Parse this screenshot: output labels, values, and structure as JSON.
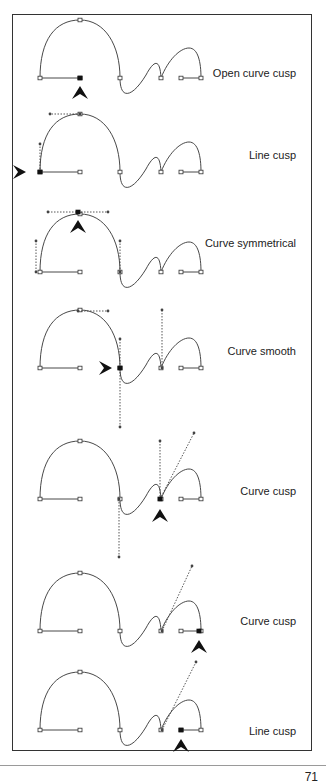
{
  "colors": {
    "stroke": "#333333",
    "handle": "#444444",
    "arrow": "#111111",
    "border": "#333333"
  },
  "page": {
    "number": "71"
  },
  "panels": [
    {
      "label": "Open curve cusp",
      "label_y": 67,
      "base": 78,
      "dy": 0,
      "arrow": {
        "x": 80,
        "y": 86,
        "dir": "up"
      },
      "selected": {
        "x": 80,
        "y": 78
      },
      "handles": []
    },
    {
      "label": "Line cusp",
      "label_y": 149,
      "base": 172,
      "dy": 94,
      "arrow": {
        "x": 26,
        "y": 172,
        "dir": "right"
      },
      "selected": {
        "x": 40,
        "y": 172
      },
      "handles": [
        [
          40,
          172,
          40,
          144
        ],
        [
          80,
          114,
          50,
          114
        ]
      ]
    },
    {
      "label": "Curve symmetrical",
      "label_y": 237,
      "base": 272,
      "dy": 194,
      "arrow": {
        "x": 78,
        "y": 220,
        "dir": "up"
      },
      "selected": {
        "x": 78,
        "y": 212
      },
      "handles": [
        [
          48,
          212,
          108,
          212
        ],
        [
          36,
          272,
          36,
          241
        ],
        [
          120,
          272,
          120,
          241
        ]
      ]
    },
    {
      "label": "Curve smooth",
      "label_y": 345,
      "base": 368,
      "dy": 290,
      "arrow": {
        "x": 112,
        "y": 368,
        "dir": "right"
      },
      "selected": {
        "x": 120,
        "y": 368
      },
      "handles": [
        [
          78,
          311,
          108,
          311
        ],
        [
          120,
          339,
          120,
          427
        ],
        [
          162,
          310,
          162,
          368
        ]
      ]
    },
    {
      "label": "Curve cusp",
      "label_y": 485,
      "base": 499,
      "dy": 421,
      "arrow": {
        "x": 160,
        "y": 509,
        "dir": "up"
      },
      "selected": {
        "x": 160,
        "y": 499
      },
      "handles": [
        [
          119,
          499,
          119,
          557
        ],
        [
          160,
          441,
          160,
          499
        ],
        [
          160,
          499,
          194,
          433
        ]
      ]
    },
    {
      "label": "Curve cusp",
      "label_y": 615,
      "base": 631,
      "dy": 553,
      "arrow": {
        "x": 199,
        "y": 640,
        "dir": "up"
      },
      "selected": {
        "x": 199,
        "y": 631
      },
      "handles": [
        [
          162,
          631,
          192,
          566
        ]
      ]
    },
    {
      "label": "Line cusp",
      "label_y": 725,
      "base": 730,
      "dy": 652,
      "arrow": {
        "x": 181,
        "y": 739,
        "dir": "up"
      },
      "selected": {
        "x": 181,
        "y": 730
      },
      "handles": [
        [
          162,
          730,
          196,
          662
        ]
      ]
    }
  ],
  "shape": {
    "comment_free_path_points": true,
    "nodes": [
      [
        40,
        78
      ],
      [
        80,
        78
      ],
      [
        80,
        20
      ],
      [
        120,
        78
      ],
      [
        161,
        78
      ],
      [
        181,
        78
      ],
      [
        201,
        78
      ]
    ],
    "path": "M40,78 C40,40 55,20 80,20 C105,20 120,45 120,78 C120,100 132,98 146,75 C154,60 160,58 161,78 C168,60 180,48 189,48 C198,48 201,62 201,78 M181,78 L201,78 M40,78 L80,78"
  }
}
